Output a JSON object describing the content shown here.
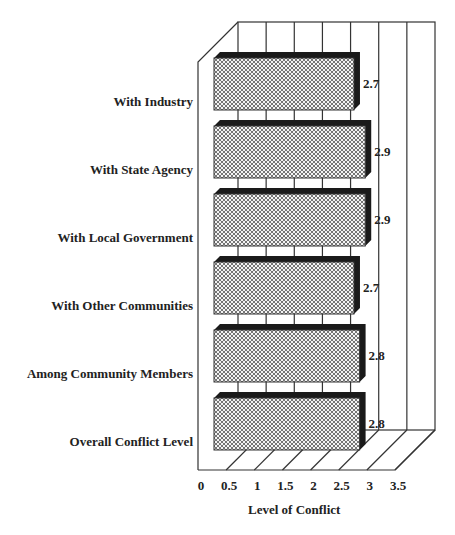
{
  "chart_data": {
    "type": "bar",
    "orientation": "horizontal",
    "style": "3d",
    "title": "",
    "xlabel": "Level of Conflict",
    "ylabel": "",
    "categories": [
      "With Industry",
      "With State Agency",
      "With Local Government",
      "With Other Communities",
      "Among Community Members",
      "Overall Conflict Level"
    ],
    "values": [
      2.7,
      2.9,
      2.9,
      2.7,
      2.8,
      2.8
    ],
    "value_labels": [
      "2.7",
      "2.9",
      "2.9",
      "2.7",
      "2.8",
      "2.8"
    ],
    "xlim": [
      0,
      3.5
    ],
    "x_ticks": [
      "0",
      "0.5",
      "1",
      "1.5",
      "2",
      "2.5",
      "3",
      "3.5"
    ],
    "grid": true,
    "legend": null,
    "bar_fill": "crosshatch",
    "colors": {
      "bar_shadow": "#1a1a1a",
      "grid": "#333333"
    }
  }
}
